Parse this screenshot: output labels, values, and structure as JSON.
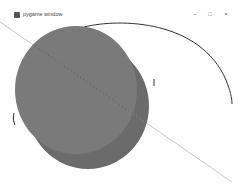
{
  "window": {
    "title": "pygame window",
    "controls": {
      "minimize": "–",
      "maximize": "□",
      "close": "×"
    }
  },
  "canvas": {
    "background": "#ffffff",
    "shapes": [
      {
        "type": "ellipse",
        "name": "back-ellipse",
        "cx": 88,
        "cy": 86,
        "rx": 61,
        "ry": 63,
        "fill": "#6b6b6b"
      },
      {
        "type": "ellipse",
        "name": "front-ellipse",
        "cx": 76,
        "cy": 70,
        "rx": 61,
        "ry": 64,
        "fill": "#7a7a7a"
      },
      {
        "type": "line",
        "name": "diagonal-line",
        "x1": 0,
        "y1": 2,
        "x2": 232,
        "y2": 162,
        "color": "#c8c8c8"
      },
      {
        "type": "arc",
        "name": "outline-arc",
        "color": "#333333"
      }
    ]
  }
}
